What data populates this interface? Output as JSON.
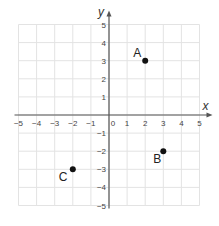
{
  "chart_data": {
    "type": "scatter",
    "title": "",
    "xlabel": "x",
    "ylabel": "y",
    "xlim": [
      -5,
      5
    ],
    "ylim": [
      -5,
      5
    ],
    "grid": true,
    "x_ticks": [
      "−5",
      "−4",
      "−3",
      "−2",
      "−1",
      "0",
      "1",
      "2",
      "3",
      "4",
      "5"
    ],
    "y_ticks": [
      "5",
      "4",
      "3",
      "2",
      "1",
      "−1",
      "−2",
      "−3",
      "−4",
      "−5"
    ],
    "points": [
      {
        "label": "A",
        "x": 2,
        "y": 3
      },
      {
        "label": "B",
        "x": 3,
        "y": -2
      },
      {
        "label": "C",
        "x": -2,
        "y": -3
      }
    ],
    "colors": {
      "grid": "#e3e3e3",
      "axis": "#555555",
      "point": "#111111"
    }
  }
}
